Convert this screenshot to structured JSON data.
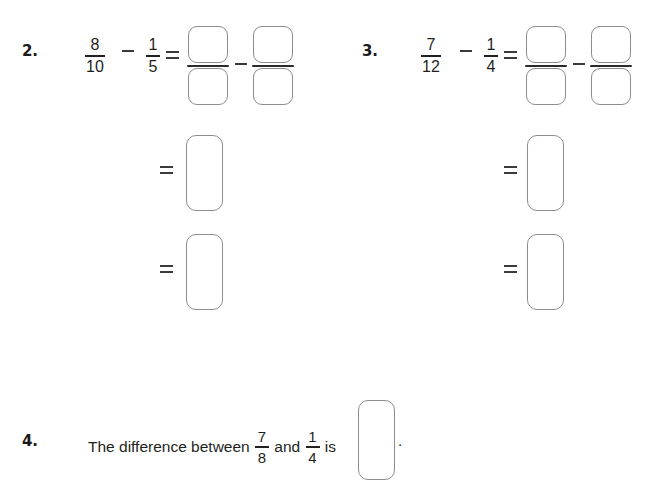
{
  "page": {
    "width": 663,
    "height": 471,
    "background": "#ffffff",
    "ink_color": "#231f20",
    "box_border_color": "#8d8d8d",
    "fraction_bar_color": "#2b2b2b"
  },
  "problems": [
    {
      "id": "q2",
      "number": "2.",
      "expression": {
        "left_fraction": {
          "numerator": "8",
          "denominator": "10"
        },
        "operator": "−",
        "right_fraction": {
          "numerator": "1",
          "denominator": "5"
        },
        "equals": "=",
        "answer_minus": "−"
      },
      "work_rows": [
        {
          "equals": "="
        },
        {
          "equals": "="
        }
      ],
      "blank_fraction_boxes": 4,
      "blank_answer_boxes": 2
    },
    {
      "id": "q3",
      "number": "3.",
      "expression": {
        "left_fraction": {
          "numerator": "7",
          "denominator": "12"
        },
        "operator": "−",
        "right_fraction": {
          "numerator": "1",
          "denominator": "4"
        },
        "equals": "=",
        "answer_minus": "−"
      },
      "work_rows": [
        {
          "equals": "="
        },
        {
          "equals": "="
        }
      ],
      "blank_fraction_boxes": 4,
      "blank_answer_boxes": 2
    },
    {
      "id": "q4",
      "number": "4.",
      "statement": {
        "lead": "The difference between",
        "first_fraction": {
          "numerator": "7",
          "denominator": "8"
        },
        "conjunction": "and",
        "second_fraction": {
          "numerator": "1",
          "denominator": "4"
        },
        "verb": "is",
        "terminator": "."
      },
      "blank_answer_boxes": 1
    }
  ]
}
